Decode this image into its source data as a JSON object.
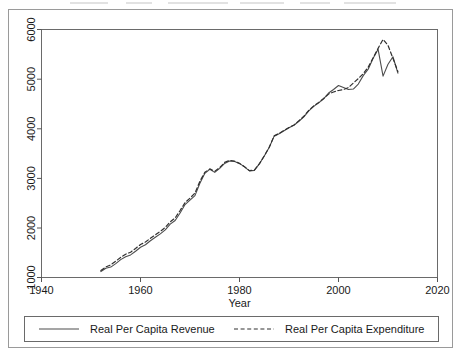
{
  "figure": {
    "background_color": "#ffffff",
    "frame_color": "#9a9a9a",
    "axis_color": "#555555"
  },
  "chart_data": {
    "type": "line",
    "title": "",
    "subtitle": "",
    "xlabel": "Year",
    "ylabel": "",
    "xlim": [
      1940,
      2020
    ],
    "ylim": [
      1000,
      6000
    ],
    "grid": false,
    "legend_position": "bottom",
    "xticks": [
      1940,
      1960,
      1980,
      2000,
      2020
    ],
    "yticks": [
      1000,
      2000,
      3000,
      4000,
      5000,
      6000
    ],
    "xtick_labels": [
      "1940",
      "1960",
      "1980",
      "2000",
      "2020"
    ],
    "ytick_labels": [
      "1000",
      "2000",
      "3000",
      "4000",
      "5000",
      "6000"
    ],
    "ytick_rotation": 90,
    "x": [
      1952,
      1953,
      1954,
      1955,
      1956,
      1957,
      1958,
      1959,
      1960,
      1961,
      1962,
      1963,
      1964,
      1965,
      1966,
      1967,
      1968,
      1969,
      1970,
      1971,
      1972,
      1973,
      1974,
      1975,
      1976,
      1977,
      1978,
      1979,
      1980,
      1981,
      1982,
      1983,
      1984,
      1985,
      1986,
      1987,
      1988,
      1989,
      1990,
      1991,
      1992,
      1993,
      1994,
      1995,
      1996,
      1997,
      1998,
      1999,
      2000,
      2001,
      2002,
      2003,
      2004,
      2005,
      2006,
      2007,
      2008,
      2009,
      2010,
      2011,
      2012
    ],
    "series": [
      {
        "name": "Real Per Capita Revenue",
        "style": "solid",
        "color": "#4d4d4d",
        "values": [
          1120,
          1185,
          1210,
          1280,
          1360,
          1420,
          1455,
          1530,
          1610,
          1660,
          1740,
          1810,
          1880,
          1960,
          2075,
          2150,
          2300,
          2470,
          2560,
          2650,
          2900,
          3100,
          3180,
          3120,
          3200,
          3300,
          3350,
          3340,
          3300,
          3230,
          3150,
          3160,
          3290,
          3450,
          3620,
          3850,
          3900,
          3960,
          4020,
          4070,
          4150,
          4240,
          4360,
          4450,
          4520,
          4600,
          4720,
          4790,
          4870,
          4830,
          4790,
          4800,
          4900,
          5070,
          5200,
          5420,
          5600,
          5060,
          5300,
          5450,
          5120
        ]
      },
      {
        "name": "Real Per Capita Expenditure",
        "style": "dashed",
        "color": "#303030",
        "values": [
          1140,
          1215,
          1255,
          1330,
          1405,
          1470,
          1510,
          1585,
          1665,
          1715,
          1790,
          1860,
          1930,
          2010,
          2120,
          2200,
          2350,
          2510,
          2600,
          2700,
          2940,
          3120,
          3190,
          3140,
          3215,
          3320,
          3360,
          3345,
          3300,
          3235,
          3155,
          3165,
          3290,
          3450,
          3625,
          3855,
          3905,
          3965,
          4025,
          4075,
          4160,
          4250,
          4370,
          4460,
          4530,
          4610,
          4700,
          4740,
          4770,
          4790,
          4830,
          4920,
          5010,
          5110,
          5240,
          5430,
          5620,
          5800,
          5680,
          5420,
          5150
        ]
      }
    ]
  },
  "legend": {
    "items": [
      {
        "label": "Real Per Capita Revenue",
        "style": "solid"
      },
      {
        "label": "Real Per Capita Expenditure",
        "style": "dashed"
      }
    ]
  }
}
